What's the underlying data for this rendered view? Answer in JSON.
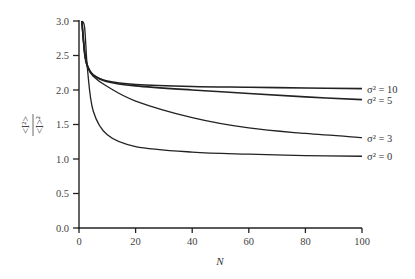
{
  "chart_data": {
    "type": "line",
    "title": "",
    "xlabel": "N",
    "ylabel": "<I²> / <I>²",
    "ylabel_parts": {
      "numerator": "<I²>",
      "denominator": "<I>²"
    },
    "xlim": [
      0,
      100
    ],
    "ylim": [
      0.0,
      3.0
    ],
    "x_ticks": [
      0,
      20,
      40,
      60,
      80,
      100
    ],
    "x_tick_labels": [
      "0",
      "20",
      "40",
      "60",
      "80",
      "100"
    ],
    "y_ticks": [
      0.0,
      0.5,
      1.0,
      1.5,
      2.0,
      2.5,
      3.0
    ],
    "y_tick_labels": [
      "0.0",
      "0.5",
      "1.0",
      "1.5",
      "2.0",
      "2.5",
      "3.0"
    ],
    "grid": false,
    "legend_position": "inline-right",
    "x": [
      1,
      2,
      3,
      5,
      10,
      20,
      40,
      60,
      80,
      100
    ],
    "series": [
      {
        "name": "σ² = 10",
        "label": "σ² = 10",
        "values": [
          3.0,
          2.55,
          2.35,
          2.22,
          2.13,
          2.08,
          2.05,
          2.04,
          2.03,
          2.02
        ]
      },
      {
        "name": "σ² = 5",
        "label": "σ² = 5",
        "values": [
          3.0,
          2.55,
          2.35,
          2.22,
          2.12,
          2.06,
          2.0,
          1.95,
          1.9,
          1.86
        ]
      },
      {
        "name": "σ² = 3",
        "label": "σ² = 3",
        "values": [
          3.0,
          2.5,
          2.33,
          2.2,
          2.05,
          1.84,
          1.6,
          1.45,
          1.37,
          1.31
        ]
      },
      {
        "name": "σ² = 0",
        "label": "σ² = 0",
        "values": [
          3.0,
          2.9,
          2.3,
          1.7,
          1.35,
          1.18,
          1.1,
          1.07,
          1.05,
          1.04
        ]
      }
    ]
  },
  "style": {
    "line_color": "#222222",
    "axis_color": "#222222",
    "text_color": "#444444"
  }
}
